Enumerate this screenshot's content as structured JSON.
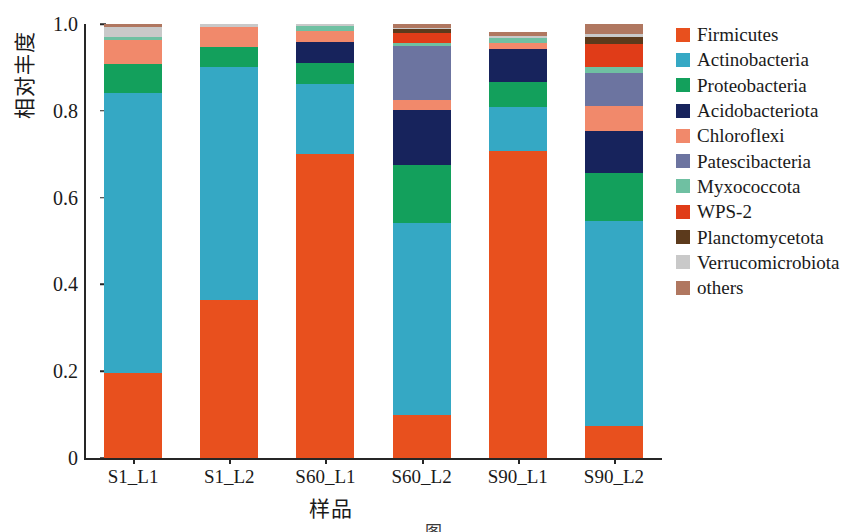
{
  "chart_data": {
    "type": "bar",
    "subtype": "stacked-bar-100pct",
    "title": "",
    "xlabel": "样品",
    "ylabel": "相对丰度",
    "ylim": [
      0,
      1.0
    ],
    "ytick_labels": [
      "0",
      "0.2",
      "0.4",
      "0.6",
      "0.8",
      "1.0"
    ],
    "ytick_values": [
      0,
      0.2,
      0.4,
      0.6,
      0.8,
      1.0
    ],
    "grid": false,
    "legend_position": "right",
    "categories": [
      "S1_L1",
      "S1_L2",
      "S60_L1",
      "S60_L2",
      "S90_L1",
      "S90_L2"
    ],
    "series": [
      {
        "name": "Firmicutes",
        "color": "#e8501e",
        "values": [
          0.195,
          0.365,
          0.765,
          0.1,
          0.708,
          0.073
        ]
      },
      {
        "name": "Actinobacteria",
        "color": "#35a8c4",
        "values": [
          0.645,
          0.535,
          0.177,
          0.442,
          0.1,
          0.473
        ]
      },
      {
        "name": "Proteobacteria",
        "color": "#13a05c",
        "values": [
          0.068,
          0.048,
          0.053,
          0.134,
          0.058,
          0.111
        ]
      },
      {
        "name": "Acidobacteriota",
        "color": "#17235c",
        "values": [
          0.0,
          0.0,
          0.053,
          0.127,
          0.076,
          0.097
        ]
      },
      {
        "name": "Chloroflexi",
        "color": "#f1896b",
        "values": [
          0.055,
          0.046,
          0.028,
          0.023,
          0.014,
          0.058
        ]
      },
      {
        "name": "Patescibacteria",
        "color": "#6c74a0",
        "values": [
          0.0,
          0.0,
          0.0,
          0.124,
          0.0,
          0.076
        ]
      },
      {
        "name": "Myxococcota",
        "color": "#6fc0a2",
        "values": [
          0.007,
          0.0,
          0.012,
          0.007,
          0.012,
          0.014
        ]
      },
      {
        "name": "WPS-2",
        "color": "#e03c18",
        "values": [
          0.0,
          0.0,
          0.0,
          0.023,
          0.0,
          0.051
        ]
      },
      {
        "name": "Planctomycetota",
        "color": "#5c3a1c",
        "values": [
          0.0,
          0.0,
          0.0,
          0.009,
          0.0,
          0.018
        ]
      },
      {
        "name": "Verrucomicrobiota",
        "color": "#c9c9c9",
        "values": [
          0.023,
          0.006,
          0.005,
          0.002,
          0.005,
          0.007
        ]
      },
      {
        "name": "others",
        "color": "#b07760",
        "values": [
          0.007,
          0.0,
          0.0,
          0.009,
          0.009,
          0.022
        ]
      }
    ]
  },
  "axes": {
    "y_label": "相对丰度",
    "x_label": "样品",
    "y_ticks": [
      "1.0",
      "0.8",
      "0.6",
      "0.4",
      "0.2",
      "0"
    ],
    "x_ticks": [
      "S1_L1",
      "S1_L2",
      "S60_L1",
      "S60_L2",
      "S90_L1",
      "S90_L2"
    ]
  },
  "legend": {
    "items": [
      {
        "label": "Firmicutes",
        "color": "#e8501e"
      },
      {
        "label": "Actinobacteria",
        "color": "#35a8c4"
      },
      {
        "label": "Proteobacteria",
        "color": "#13a05c"
      },
      {
        "label": "Acidobacteriota",
        "color": "#17235c"
      },
      {
        "label": "Chloroflexi",
        "color": "#f1896b"
      },
      {
        "label": "Patescibacteria",
        "color": "#6c74a0"
      },
      {
        "label": "Myxococcota",
        "color": "#6fc0a2"
      },
      {
        "label": "WPS-2",
        "color": "#e03c18"
      },
      {
        "label": "Planctomycetota",
        "color": "#5c3a1c"
      },
      {
        "label": "Verrucomicrobiota",
        "color": "#c9c9c9"
      },
      {
        "label": "others",
        "color": "#b07760"
      }
    ]
  },
  "caption": "图"
}
